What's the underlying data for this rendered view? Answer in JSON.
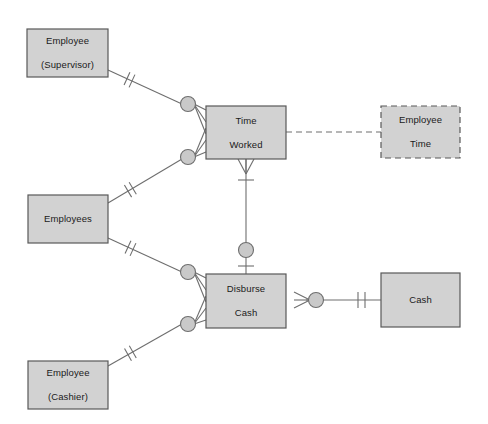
{
  "diagram": {
    "type": "entity-relationship-diagram",
    "notation": "crows-foot",
    "background_color": "#ffffff",
    "entity_fill": "#d2d2d2",
    "entity_stroke": "#595959",
    "line_color": "#6e6e6e",
    "entities": [
      {
        "id": "employee-supervisor",
        "label": "Employee\n(Supervisor)",
        "line1": "Employee",
        "line2": "(Supervisor)",
        "style": "solid",
        "x": 27,
        "y": 29,
        "w": 81,
        "h": 48
      },
      {
        "id": "employees",
        "label": "Employees",
        "line1": "Employees",
        "line2": "",
        "style": "solid",
        "x": 28,
        "y": 195,
        "w": 80,
        "h": 48
      },
      {
        "id": "employee-cashier",
        "label": "Employee\n(Cashier)",
        "line1": "Employee",
        "line2": "(Cashier)",
        "style": "solid",
        "x": 28,
        "y": 361,
        "w": 80,
        "h": 48
      },
      {
        "id": "time-worked",
        "label": "Time\nWorked",
        "line1": "Time",
        "line2": "Worked",
        "style": "solid",
        "x": 206,
        "y": 106,
        "w": 80,
        "h": 53
      },
      {
        "id": "disburse-cash",
        "label": "Disburse\nCash",
        "line1": "Disburse",
        "line2": "Cash",
        "style": "solid",
        "x": 206,
        "y": 274,
        "w": 80,
        "h": 54
      },
      {
        "id": "employee-time",
        "label": "Employee\nTime",
        "line1": "Employee",
        "line2": "Time",
        "style": "dashed",
        "x": 381,
        "y": 106,
        "w": 79,
        "h": 52
      },
      {
        "id": "cash",
        "label": "Cash",
        "line1": "Cash",
        "line2": "",
        "style": "solid",
        "x": 381,
        "y": 273,
        "w": 79,
        "h": 54
      }
    ],
    "relationships": [
      {
        "id": "supervisor-to-time-worked",
        "from": "employee-supervisor",
        "to": "time-worked",
        "style": "solid",
        "from_cardinality": "one-and-only-one",
        "to_cardinality": "zero-or-many"
      },
      {
        "id": "employees-to-time-worked",
        "from": "employees",
        "to": "time-worked",
        "style": "solid",
        "from_cardinality": "one-and-only-one",
        "to_cardinality": "zero-or-many"
      },
      {
        "id": "employees-to-disburse-cash",
        "from": "employees",
        "to": "disburse-cash",
        "style": "solid",
        "from_cardinality": "one-and-only-one",
        "to_cardinality": "zero-or-many"
      },
      {
        "id": "cashier-to-disburse-cash",
        "from": "employee-cashier",
        "to": "disburse-cash",
        "style": "solid",
        "from_cardinality": "one-and-only-one",
        "to_cardinality": "zero-or-many"
      },
      {
        "id": "time-worked-to-disburse-cash",
        "from": "time-worked",
        "to": "disburse-cash",
        "style": "solid",
        "from_cardinality": "one-or-many",
        "to_cardinality": "zero-or-one"
      },
      {
        "id": "disburse-cash-to-cash",
        "from": "disburse-cash",
        "to": "cash",
        "style": "solid",
        "from_cardinality": "zero-or-many",
        "to_cardinality": "one-and-only-one"
      },
      {
        "id": "time-worked-to-employee-time",
        "from": "time-worked",
        "to": "employee-time",
        "style": "dashed",
        "from_cardinality": "none",
        "to_cardinality": "none"
      }
    ]
  }
}
